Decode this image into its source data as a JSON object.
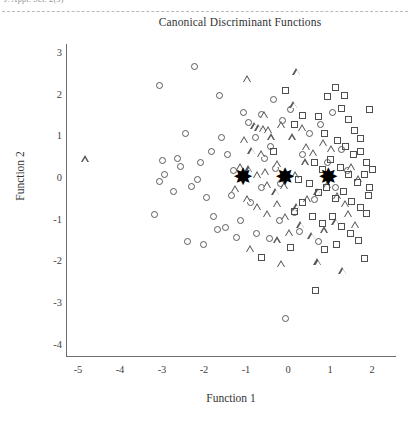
{
  "page": {
    "clipped_header_text": "J. Appl. Sci. 2(3)",
    "header_rule": "dashed-rule"
  },
  "chart_data": {
    "type": "scatter",
    "title": "Canonical Discriminant Functions",
    "xlabel": "Function 1",
    "ylabel": "Function 2",
    "xlim": [
      -5.6,
      2.5
    ],
    "ylim": [
      -4.4,
      3.4
    ],
    "xticks": [
      -5,
      -4,
      -3,
      -2,
      -1,
      0,
      1,
      2
    ],
    "yticks": [
      3,
      2,
      1,
      0,
      -1,
      -2,
      -3,
      -4
    ],
    "xtick_labels": [
      "-5",
      "-4",
      "-3",
      "-2",
      "-1",
      "0",
      "1",
      "2"
    ],
    "ytick_labels": [
      "3",
      "2",
      "1",
      "0",
      "-1",
      "-2",
      "-3",
      "-4"
    ],
    "grid": false,
    "legend": null,
    "marker_color": "#555555",
    "centroid_color": "#000000",
    "series": [
      {
        "name": "Group 1",
        "marker": "circle",
        "points": [
          [
            -3.05,
            2.2
          ],
          [
            -2.23,
            2.65
          ],
          [
            -1.62,
            1.95
          ],
          [
            -1.05,
            1.55
          ],
          [
            -1.58,
            0.95
          ],
          [
            -2.62,
            0.45
          ],
          [
            -2.55,
            0.25
          ],
          [
            -2.98,
            0.4
          ],
          [
            -2.95,
            0.05
          ],
          [
            -3.05,
            -0.1
          ],
          [
            -2.72,
            -0.35
          ],
          [
            -3.18,
            -0.9
          ],
          [
            -2.3,
            -0.22
          ],
          [
            -2.08,
            0.35
          ],
          [
            -2.15,
            -0.05
          ],
          [
            -1.95,
            -0.5
          ],
          [
            -1.82,
            0.6
          ],
          [
            -1.78,
            -0.95
          ],
          [
            -1.5,
            -1.2
          ],
          [
            -1.35,
            -0.45
          ],
          [
            -1.3,
            0.15
          ],
          [
            -1.22,
            -1.45
          ],
          [
            -2.4,
            -1.55
          ],
          [
            -2.02,
            -1.62
          ],
          [
            -1.68,
            -1.25
          ],
          [
            -1.12,
            -1.05
          ],
          [
            -0.95,
            1.3
          ],
          [
            -0.78,
            0.95
          ],
          [
            -0.62,
            1.5
          ],
          [
            -0.35,
            1.85
          ],
          [
            -0.12,
            1.35
          ],
          [
            0.05,
            1.62
          ],
          [
            -0.55,
            0.45
          ],
          [
            -0.3,
            0.2
          ],
          [
            -0.18,
            -0.15
          ],
          [
            -0.62,
            -0.25
          ],
          [
            -0.9,
            -0.6
          ],
          [
            -0.75,
            -1.35
          ],
          [
            -0.45,
            -1.48
          ],
          [
            -0.2,
            -1.05
          ],
          [
            0.15,
            -0.85
          ],
          [
            0.35,
            0.55
          ],
          [
            0.52,
            1.05
          ],
          [
            0.78,
            1.25
          ],
          [
            0.95,
            0.35
          ],
          [
            1.12,
            -0.25
          ],
          [
            1.28,
            0.65
          ],
          [
            0.62,
            -0.55
          ],
          [
            0.28,
            -1.3
          ],
          [
            -0.05,
            -3.4
          ],
          [
            -1.45,
            0.55
          ],
          [
            -0.42,
            0.72
          ],
          [
            0.72,
            -1.55
          ],
          [
            1.05,
            1.55
          ],
          [
            -2.45,
            1.05
          ],
          [
            1.42,
            0.15
          ]
        ]
      },
      {
        "name": "Group 2",
        "marker": "triangle",
        "points": [
          [
            -4.82,
            0.42
          ],
          [
            -0.95,
            2.35
          ],
          [
            0.22,
            2.52
          ],
          [
            -0.55,
            1.48
          ],
          [
            -0.78,
            1.22
          ],
          [
            -0.68,
            1.18
          ],
          [
            -0.58,
            1.15
          ],
          [
            -0.45,
            1.12
          ],
          [
            -1.02,
            0.88
          ],
          [
            -0.85,
            0.62
          ],
          [
            -0.62,
            0.55
          ],
          [
            -0.38,
            0.95
          ],
          [
            -0.15,
            1.25
          ],
          [
            0.12,
            0.95
          ],
          [
            0.35,
            1.18
          ],
          [
            -0.25,
            0.32
          ],
          [
            -0.52,
            0.12
          ],
          [
            -0.72,
            0.05
          ],
          [
            -0.92,
            0.18
          ],
          [
            -1.12,
            0.25
          ],
          [
            -0.48,
            -0.18
          ],
          [
            -0.28,
            -0.35
          ],
          [
            -0.08,
            -0.22
          ],
          [
            0.18,
            0.05
          ],
          [
            0.42,
            0.35
          ],
          [
            0.62,
            0.58
          ],
          [
            0.85,
            0.82
          ],
          [
            1.05,
            0.68
          ],
          [
            -0.95,
            -0.52
          ],
          [
            -0.72,
            -0.72
          ],
          [
            -0.48,
            -0.88
          ],
          [
            -0.25,
            -0.65
          ],
          [
            -0.05,
            -0.95
          ],
          [
            0.22,
            -0.72
          ],
          [
            0.48,
            -0.52
          ],
          [
            0.72,
            -0.35
          ],
          [
            0.95,
            -0.18
          ],
          [
            1.18,
            -0.45
          ],
          [
            1.38,
            -0.65
          ],
          [
            0.32,
            -1.15
          ],
          [
            0.05,
            -1.35
          ],
          [
            -0.25,
            -1.52
          ],
          [
            0.58,
            -1.42
          ],
          [
            0.88,
            -1.28
          ],
          [
            1.15,
            -1.08
          ],
          [
            -0.15,
            -2.08
          ],
          [
            0.72,
            -2.05
          ],
          [
            1.32,
            -2.25
          ],
          [
            1.52,
            0.25
          ],
          [
            1.68,
            -0.05
          ],
          [
            0.45,
            0.72
          ],
          [
            -1.25,
            -0.28
          ],
          [
            1.62,
            -1.15
          ],
          [
            0.15,
            1.72
          ],
          [
            -0.88,
            -1.72
          ],
          [
            1.45,
            -0.88
          ]
        ]
      },
      {
        "name": "Group 3",
        "marker": "square",
        "points": [
          [
            -0.05,
            2.08
          ],
          [
            0.95,
            1.92
          ],
          [
            1.12,
            2.15
          ],
          [
            1.28,
            1.65
          ],
          [
            0.72,
            1.45
          ],
          [
            1.45,
            1.38
          ],
          [
            1.58,
            1.12
          ],
          [
            1.72,
            0.92
          ],
          [
            0.35,
            1.48
          ],
          [
            0.15,
            1.25
          ],
          [
            0.88,
            1.05
          ],
          [
            1.18,
            0.88
          ],
          [
            1.38,
            0.72
          ],
          [
            1.55,
            0.55
          ],
          [
            1.72,
            0.62
          ],
          [
            1.88,
            0.35
          ],
          [
            0.62,
            0.35
          ],
          [
            0.82,
            0.18
          ],
          [
            1.02,
            0.42
          ],
          [
            1.25,
            0.22
          ],
          [
            1.45,
            0.05
          ],
          [
            1.65,
            -0.12
          ],
          [
            1.82,
            0.05
          ],
          [
            1.95,
            -0.25
          ],
          [
            0.52,
            -0.15
          ],
          [
            0.72,
            -0.38
          ],
          [
            0.92,
            -0.25
          ],
          [
            1.12,
            -0.52
          ],
          [
            1.32,
            -0.35
          ],
          [
            1.52,
            -0.58
          ],
          [
            1.72,
            -0.72
          ],
          [
            1.88,
            -0.88
          ],
          [
            0.35,
            -0.62
          ],
          [
            0.15,
            -0.82
          ],
          [
            0.58,
            -0.95
          ],
          [
            0.82,
            -1.12
          ],
          [
            1.05,
            -0.95
          ],
          [
            1.28,
            -1.18
          ],
          [
            1.48,
            -1.35
          ],
          [
            1.68,
            -1.52
          ],
          [
            1.15,
            -1.62
          ],
          [
            0.88,
            -1.75
          ],
          [
            1.82,
            -1.95
          ],
          [
            0.65,
            -2.72
          ],
          [
            1.95,
            1.62
          ],
          [
            -0.35,
            0.62
          ],
          [
            0.25,
            -0.05
          ],
          [
            2.02,
            0.18
          ],
          [
            1.35,
            1.95
          ],
          [
            0.05,
            -1.68
          ],
          [
            1.92,
            -0.45
          ],
          [
            -0.62,
            -1.92
          ]
        ]
      }
    ],
    "centroids": [
      {
        "name": "Group 1 centroid",
        "x": -1.07,
        "y": 0.0
      },
      {
        "name": "Group 2 centroid",
        "x": -0.07,
        "y": 0.0
      },
      {
        "name": "Group 3 centroid",
        "x": 0.96,
        "y": 0.0
      }
    ],
    "centroid_glyph": "✸"
  }
}
